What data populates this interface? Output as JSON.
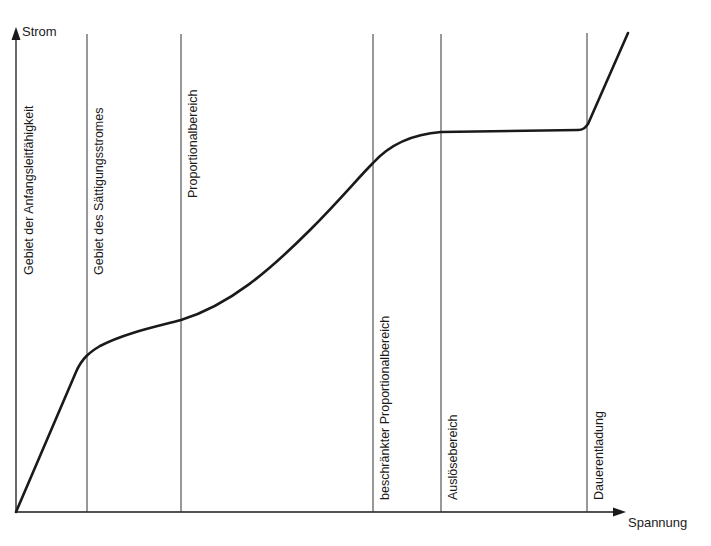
{
  "diagram": {
    "y_axis_label": "Strom",
    "x_axis_label": "Spannung",
    "regions": [
      {
        "label": "Gebiet der Anfangsleitfähigkeit",
        "boundary_x": 16
      },
      {
        "label": "Gebiet des Sättigungsstromes",
        "boundary_x": 87
      },
      {
        "label": "Proportionalbereich",
        "boundary_x": 181
      },
      {
        "label": "beschränkter Proportionalbereich",
        "boundary_x": 373
      },
      {
        "label": "Auslösebereich",
        "boundary_x": 441
      },
      {
        "label": "Dauerentladung",
        "boundary_x": 587
      }
    ],
    "curve_description": "Strom-Spannungs-Kennlinie: linearer Anstieg, Sättigung, proportionaler Anstieg, Plateau, steiler Anstieg",
    "colors": {
      "line": "#1a1a1a",
      "background": "#ffffff"
    }
  }
}
